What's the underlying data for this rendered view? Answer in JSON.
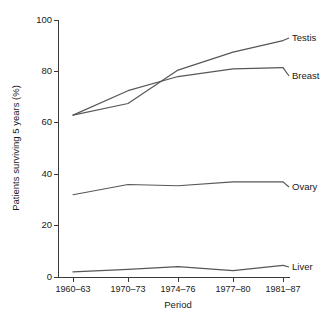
{
  "chart_data": {
    "type": "line",
    "title": "",
    "xlabel": "Period",
    "ylabel": "Patients surviving 5 years (%)",
    "categories": [
      "1960–63",
      "1970–73",
      "1974–76",
      "1977–80",
      "1981–87"
    ],
    "ylim": [
      0,
      100
    ],
    "yticks": [
      0,
      20,
      40,
      60,
      80,
      100
    ],
    "ytick_labels": [
      "0",
      "20",
      "40",
      "60",
      "80",
      "100"
    ],
    "grid": false,
    "legend_position": "right-inline-labels",
    "line_color": "#575757",
    "axis_color": "#3a3a3a",
    "series": [
      {
        "name": "Testis",
        "label": "Testis",
        "values": [
          63,
          67.5,
          80.5,
          87.5,
          92
        ]
      },
      {
        "name": "Breast",
        "label": "Breast",
        "values": [
          63,
          72.5,
          78,
          81,
          81.5
        ]
      },
      {
        "name": "Ovary",
        "label": "Ovary",
        "values": [
          32,
          36,
          35.5,
          37,
          37
        ]
      },
      {
        "name": "Liver",
        "label": "Liver",
        "values": [
          2,
          3,
          4,
          2.5,
          4.5
        ]
      }
    ]
  }
}
